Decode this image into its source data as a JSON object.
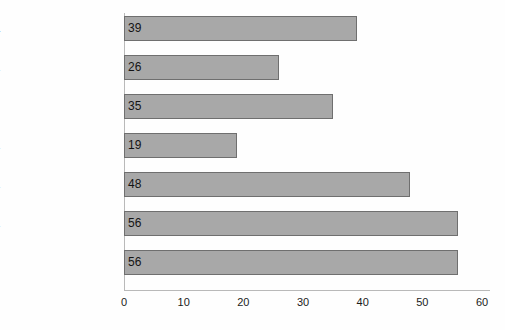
{
  "chart_data": {
    "type": "bar",
    "orientation": "horizontal",
    "title": "",
    "subtitle": "",
    "xlabel": "",
    "ylabel": "",
    "categories": [
      "Africa",
      "Asia",
      "Eastern Central Europe",
      "Latin America",
      "North America",
      "Oceania",
      "Western Europe"
    ],
    "values": [
      39,
      26,
      35,
      19,
      48,
      56,
      56
    ],
    "value_labels": [
      "39",
      "26",
      "35",
      "19",
      "48",
      "56",
      "56"
    ],
    "xlim": [
      0,
      60
    ],
    "x_ticks": [
      0,
      10,
      20,
      30,
      40,
      50,
      60
    ],
    "x_tick_labels": [
      "0",
      "10",
      "20",
      "30",
      "40",
      "50",
      "60"
    ],
    "grid": false,
    "legend": false,
    "legend_position": "none",
    "bar_fill_color": "#a8a8a8",
    "bar_border_color": "#6f6f6f",
    "axis_color": "#b9b9b9",
    "text_color": "#1b1b1b",
    "background_color": "#fefefe"
  }
}
